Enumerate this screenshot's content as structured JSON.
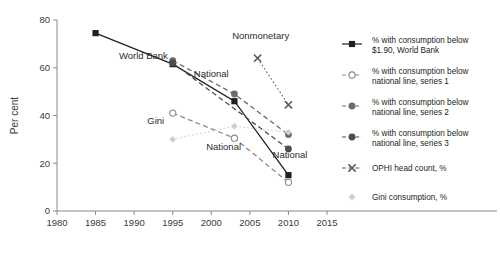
{
  "chart_data": {
    "type": "line",
    "title": "",
    "xlabel": "",
    "ylabel": "Per cent",
    "xlim": [
      1980,
      2015
    ],
    "ylim": [
      0,
      80
    ],
    "xticks": [
      1980,
      1985,
      1990,
      1995,
      2000,
      2005,
      2010,
      2015
    ],
    "yticks": [
      0,
      20,
      40,
      60,
      80
    ],
    "grid": false,
    "legend_position": "right",
    "series": [
      {
        "name": "% with consumption below $1.90, World Bank",
        "short": "World Bank",
        "marker": "filled-square",
        "line": "solid",
        "color": "#231f20",
        "x": [
          1985,
          1995,
          2003,
          2010
        ],
        "values": [
          74.5,
          61.5,
          46,
          15
        ]
      },
      {
        "name": "% with consumption below national line, series 1",
        "short": "National",
        "marker": "open-circle",
        "line": "dashed",
        "color": "#8c8c8c",
        "x": [
          1995,
          2003,
          2010
        ],
        "values": [
          41,
          30.5,
          12
        ]
      },
      {
        "name": "% with consumption below national line, series 2",
        "short": "National",
        "marker": "filled-circle",
        "line": "dashed",
        "color": "#6b6b6b",
        "x": [
          1995,
          2003,
          2010
        ],
        "values": [
          63,
          49,
          32
        ]
      },
      {
        "name": "% with consumption below national line, series 3",
        "short": "National",
        "marker": "filled-circle",
        "line": "dashed",
        "color": "#4d4d4d",
        "x": [
          1995,
          2010
        ],
        "values": [
          62,
          26
        ]
      },
      {
        "name": "OPHI head count, %",
        "short": "Nonmonetary",
        "marker": "cross",
        "line": "dotted",
        "color": "#5a5a5a",
        "x": [
          2006,
          2010
        ],
        "values": [
          64,
          44.5
        ]
      },
      {
        "name": "Gini consumption, %",
        "short": "Gini",
        "marker": "diamond",
        "line": "dotted",
        "color": "#cfcfcf",
        "x": [
          1995,
          2003,
          2010
        ],
        "values": [
          30,
          35.5,
          33
        ]
      }
    ],
    "annotations": [
      {
        "text": "World Bank",
        "x": 1991.2,
        "y": 63.5
      },
      {
        "text": "National",
        "x": 2000.0,
        "y": 56.0
      },
      {
        "text": "Nonmonetary",
        "x": 2006.4,
        "y": 72.0
      },
      {
        "text": "Gini",
        "x": 1992.8,
        "y": 36.5
      },
      {
        "text": "National",
        "x": 2001.6,
        "y": 25.5
      },
      {
        "text": "National",
        "x": 2010.2,
        "y": 22.0
      }
    ]
  },
  "axis": {
    "ylabel": "Per cent",
    "xtick_labels": [
      "1980",
      "1985",
      "1990",
      "1995",
      "2000",
      "2005",
      "2010",
      "2015"
    ],
    "ytick_labels": [
      "0",
      "20",
      "40",
      "60",
      "80"
    ]
  },
  "legend": {
    "items": [
      {
        "label_line1": "% with consumption below",
        "label_line2": "$1.90, World Bank",
        "marker": "filled-square",
        "line": "solid",
        "color": "#231f20"
      },
      {
        "label_line1": "% with consumption below",
        "label_line2": "national line, series 1",
        "marker": "open-circle",
        "line": "dashed",
        "color": "#8c8c8c"
      },
      {
        "label_line1": "% with consumption below",
        "label_line2": "national line, series 2",
        "marker": "filled-circle",
        "line": "dashed",
        "color": "#6b6b6b"
      },
      {
        "label_line1": "% with consumption below",
        "label_line2": "national line, series 3",
        "marker": "filled-circle",
        "line": "dashed",
        "color": "#4d4d4d"
      },
      {
        "label_line1": "OPHI head count, %",
        "label_line2": "",
        "marker": "cross",
        "line": "dotted",
        "color": "#5a5a5a"
      },
      {
        "label_line1": "Gini consumption, %",
        "label_line2": "",
        "marker": "diamond",
        "line": "none",
        "color": "#cfcfcf"
      }
    ]
  }
}
